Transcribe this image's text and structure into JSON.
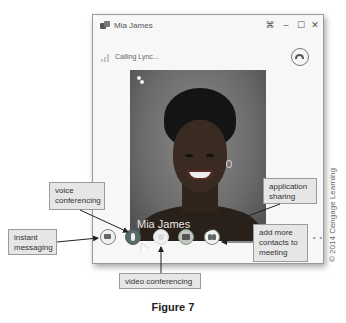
{
  "window": {
    "title": "Mia James",
    "status": "Calling Lync...",
    "controls": {
      "compact_icon": "compact-view-icon",
      "minimize_icon": "minimize-icon",
      "maximize_icon": "maximize-icon",
      "close_icon": "close-icon"
    },
    "hangup_icon": "hang-up-icon"
  },
  "video": {
    "participant_name": "Mia James",
    "mute_icon": "mute-icon"
  },
  "toolbar": {
    "buttons": [
      {
        "id": "im",
        "icon": "instant-message-icon",
        "label": "instant messaging"
      },
      {
        "id": "voice",
        "icon": "phone-icon",
        "label": "voice conferencing"
      },
      {
        "id": "video",
        "icon": "video-icon",
        "label": "video conferencing"
      },
      {
        "id": "share",
        "icon": "screen-share-icon",
        "label": "application sharing"
      },
      {
        "id": "people",
        "icon": "people-icon",
        "label": "add more contacts to meeting"
      }
    ],
    "more": "• •"
  },
  "callouts": {
    "voice": "voice conferencing",
    "im": "instant messaging",
    "share": "application sharing",
    "people": "add more contacts to meeting",
    "video": "video conferencing"
  },
  "copyright": "© 2014 Cengage Learning",
  "figure_caption": "Figure 7"
}
